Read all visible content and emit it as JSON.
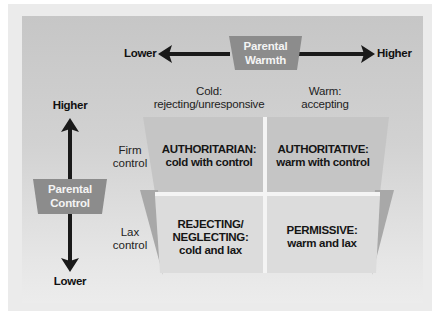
{
  "diagram": {
    "warmth_axis": {
      "label_line1": "Parental",
      "label_line2": "Warmth",
      "low_label": "Lower",
      "high_label": "Higher"
    },
    "control_axis": {
      "label_line1": "Parental",
      "label_line2": "Control",
      "high_label": "Higher",
      "low_label": "Lower"
    },
    "columns": [
      {
        "line1": "Cold:",
        "line2": "rejecting/unresponsive"
      },
      {
        "line1": "Warm:",
        "line2": "accepting"
      }
    ],
    "rows": [
      {
        "line1": "Firm",
        "line2": "control"
      },
      {
        "line1": "Lax",
        "line2": "control"
      }
    ],
    "quadrants": [
      {
        "lines": [
          "AUTHORITARIAN:",
          "cold with control"
        ]
      },
      {
        "lines": [
          "AUTHORITATIVE:",
          "warm with control"
        ]
      },
      {
        "lines": [
          "REJECTING/",
          "NEGLECTING:",
          "cold and lax"
        ]
      },
      {
        "lines": [
          "PERMISSIVE:",
          "warm and lax"
        ]
      }
    ],
    "colors": {
      "panel_top": "#c6c6c6",
      "panel_bottom": "#ececec",
      "tag_fill": "#8c8c8c",
      "quadrant_top": "#c4c4c4",
      "quadrant_bottom": "#dedede",
      "shadow": "#a9a9a9",
      "arrow": "#1a1a1a"
    }
  }
}
